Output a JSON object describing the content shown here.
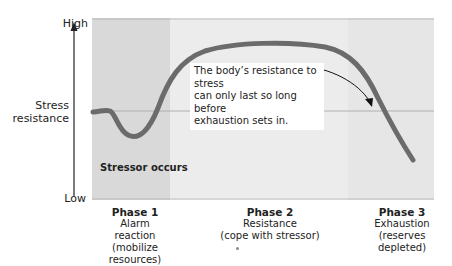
{
  "axis": {
    "high_label": "High",
    "low_label": "Low",
    "y_label_line1": "Stress",
    "y_label_line2": "resistance"
  },
  "annotation": {
    "stressor_label": "Stressor occurs",
    "note_line1": "The body’s resistance to stress",
    "note_line2": "can only last so long before",
    "note_line3": "exhaustion sets in."
  },
  "phases": [
    {
      "title": "Phase 1",
      "line1": "Alarm reaction",
      "line2": "(mobilize",
      "line3": "resources)"
    },
    {
      "title": "Phase 2",
      "line1": "Resistance",
      "line2": "(cope with stressor)",
      "line3": ""
    },
    {
      "title": "Phase 3",
      "line1": "Exhaustion",
      "line2": "(reserves",
      "line3": "depleted)"
    }
  ],
  "colors": {
    "curve": "#6b6b6b",
    "baseline": "#b0b0b0",
    "phase1_bg": "#d9d9d9",
    "phase2_bg": "#ececec",
    "phase3_bg": "#e6e6e6",
    "arrow": "#111111"
  }
}
